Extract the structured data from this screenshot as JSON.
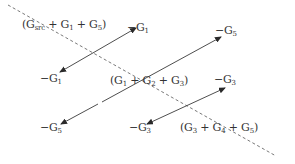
{
  "diagram": {
    "colors": {
      "line": "#3a3a3a",
      "dashed": "#6a6a6a",
      "text": "#333333",
      "background": "#ffffff"
    },
    "diagonal_terms": [
      {
        "id": "d1",
        "text": "(G",
        "sub": "src",
        "rest": " + G",
        "sub2": "1",
        "rest2": " + G",
        "sub3": "5",
        "close": ")",
        "full": "(G_src + G_1 + G_5)"
      },
      {
        "id": "d2",
        "text": "(G",
        "sub": "1",
        "rest": " + G",
        "sub2": "2",
        "rest2": " + G",
        "sub3": "3",
        "close": ")",
        "full": "(G_1 + G_2 + G_3)"
      },
      {
        "id": "d3",
        "text": "(G",
        "sub": "3",
        "rest": " + G",
        "sub2": "4",
        "rest2": " + G",
        "sub3": "5",
        "close": ")",
        "full": "(G_3 + G_4 + G_5)"
      }
    ],
    "off_diagonal_terms": [
      {
        "id": "g1_top",
        "prefix": "−G",
        "sub": "1",
        "full": "-G_1"
      },
      {
        "id": "g1_left",
        "prefix": "−G",
        "sub": "1",
        "full": "-G_1"
      },
      {
        "id": "g5_top",
        "prefix": "−G",
        "sub": "5",
        "full": "-G_5"
      },
      {
        "id": "g5_left",
        "prefix": "−G",
        "sub": "5",
        "full": "-G_5"
      },
      {
        "id": "g3_right",
        "prefix": "−G",
        "sub": "3",
        "full": "-G_3"
      },
      {
        "id": "g3_bottom",
        "prefix": "−G",
        "sub": "3",
        "full": "-G_3"
      }
    ],
    "arrows": [
      {
        "id": "arrow-g1",
        "from": [
          60,
          72
        ],
        "to": [
          136,
          28
        ],
        "double_headed": true,
        "connects": [
          "g1_left",
          "g1_top"
        ]
      },
      {
        "id": "arrow-g5",
        "from": [
          61,
          124
        ],
        "to": [
          221,
          37
        ],
        "double_headed": true,
        "connects": [
          "g5_left",
          "g5_top"
        ]
      },
      {
        "id": "arrow-g3",
        "from": [
          147,
          124
        ],
        "to": [
          225,
          88
        ],
        "double_headed": true,
        "connects": [
          "g3_bottom",
          "g3_right"
        ]
      }
    ],
    "dashed_line": {
      "from": [
        8,
        5
      ],
      "to": [
        276,
        156
      ]
    }
  }
}
